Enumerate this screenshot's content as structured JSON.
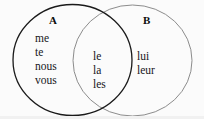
{
  "figure": {
    "type": "venn-diagram",
    "sets": [
      {
        "id": "A",
        "label": "A",
        "stroke_color": "#1a1a1a",
        "stroke_width": 1.3,
        "exclusive_items": [
          "me",
          "te",
          "nous",
          "vous"
        ]
      },
      {
        "id": "B",
        "label": "B",
        "stroke_color": "#8c8c8c",
        "stroke_width": 1.0,
        "exclusive_items": [
          "lui",
          "leur"
        ]
      }
    ],
    "intersection": {
      "items": [
        "le",
        "la",
        "les"
      ]
    },
    "background_color": "#fbfbfb",
    "text_color": "#16161a"
  }
}
